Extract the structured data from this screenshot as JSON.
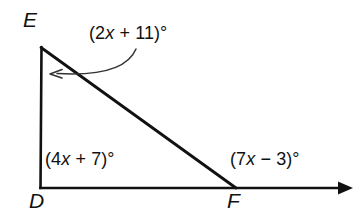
{
  "figure": {
    "background_color": "#ffffff",
    "stroke_color": "#111111",
    "vertices": {
      "E": {
        "label": "E",
        "x": 41,
        "y": 47
      },
      "D": {
        "label": "D",
        "x": 41,
        "y": 188
      },
      "F": {
        "label": "F",
        "x": 235,
        "y": 188
      }
    },
    "labels": {
      "E": "E",
      "D": "D",
      "F": "F"
    },
    "angle_expressions": {
      "at_E": {
        "text": "(2x + 11)°",
        "prefix": "(2",
        "variable": "x",
        "suffix": " + 11)°"
      },
      "at_D": {
        "text": "(4x + 7)°",
        "prefix": "(4",
        "variable": "x",
        "suffix": " + 7)°"
      },
      "exterior_at_F": {
        "text": "(7x − 3)°",
        "prefix": "(7",
        "variable": "x",
        "suffix": " − 3)°"
      }
    },
    "segments": [
      {
        "name": "side-DE",
        "from": "D",
        "to": "E"
      },
      {
        "name": "side-EF",
        "from": "E",
        "to": "F"
      },
      {
        "name": "ray-DF-extended",
        "from": "D",
        "to": "arrow-end"
      }
    ],
    "ray": {
      "start_x": 41,
      "end_x": 350,
      "y": 188,
      "arrowhead": "solid-triangle"
    },
    "pointer_arrow": {
      "name": "curved-arrow-to-angle-E",
      "start_x": 135,
      "start_y": 50,
      "end_x": 50,
      "end_y": 74,
      "arrowhead": "open-chevron",
      "points_to": "at_E"
    }
  }
}
